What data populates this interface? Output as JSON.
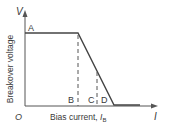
{
  "diagram": {
    "y_axis": {
      "symbol": "V",
      "label": "Breakover voltage"
    },
    "x_axis": {
      "symbol": "I",
      "label": "Bias current, ",
      "label_sub_main": "I",
      "label_sub": "B"
    },
    "origin": "O",
    "points": {
      "A": "A",
      "B": "B",
      "C": "C",
      "D": "D"
    }
  }
}
